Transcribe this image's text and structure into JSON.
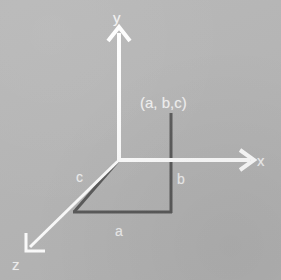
{
  "figure": {
    "kind": "3d-cartesian-axes-diagram",
    "width": 281,
    "height": 280,
    "background_color": "#b6b6b6",
    "axis_color": "#ffffff",
    "projection_line_color": "#5a5a5a"
  },
  "axes": [
    {
      "id": "y",
      "label": "y",
      "label_x": 113,
      "label_y": 10,
      "from": {
        "x": 119,
        "y": 160
      },
      "to": {
        "x": 119,
        "y": 27
      },
      "color": "#ffffff",
      "arrow": true
    },
    {
      "id": "x",
      "label": "x",
      "label_x": 257,
      "label_y": 153,
      "from": {
        "x": 119,
        "y": 160
      },
      "to": {
        "x": 257,
        "y": 160
      },
      "color": "#ffffff",
      "arrow": true
    },
    {
      "id": "z",
      "label": "z",
      "label_x": 12,
      "label_y": 257,
      "from": {
        "x": 119,
        "y": 160
      },
      "to": {
        "x": 28,
        "y": 249
      },
      "color": "#ffffff",
      "arrow": true
    }
  ],
  "origin": {
    "x": 119,
    "y": 160
  },
  "point": {
    "label": "(a, b,c)",
    "label_x": 140,
    "label_y": 95,
    "color": "#f2f2f2"
  },
  "projection_edges": [
    {
      "id": "c",
      "label": "c",
      "label_x": 76,
      "label_y": 170,
      "from": {
        "x": 119,
        "y": 160
      },
      "to": {
        "x": 74,
        "y": 212
      },
      "color": "#5a5a5a",
      "width": 3
    },
    {
      "id": "a",
      "label": "a",
      "label_x": 115,
      "label_y": 224,
      "from": {
        "x": 74,
        "y": 212
      },
      "to": {
        "x": 172,
        "y": 212
      },
      "color": "#5a5a5a",
      "width": 3
    },
    {
      "id": "b",
      "label": "b",
      "label_x": 177,
      "label_y": 172,
      "from": {
        "x": 172,
        "y": 212
      },
      "to": {
        "x": 172,
        "y": 113
      },
      "color": "#5a5a5a",
      "width": 3
    }
  ]
}
